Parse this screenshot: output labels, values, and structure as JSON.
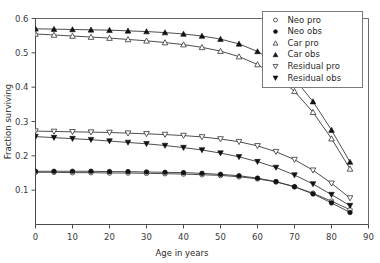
{
  "chart_data": {
    "type": "line",
    "title": "",
    "xlabel": "Age in years",
    "ylabel": "Fraction surviving",
    "xlim": [
      0,
      90
    ],
    "ylim": [
      0,
      0.6
    ],
    "xticks": [
      0,
      10,
      20,
      30,
      40,
      50,
      60,
      70,
      80,
      90
    ],
    "xticklabels": [
      "0",
      "10",
      "20",
      "30",
      "40",
      "50",
      "60",
      "70",
      "80",
      "90"
    ],
    "yticks": [
      0.1,
      0.2,
      0.3,
      0.4,
      0.5,
      0.6
    ],
    "yticklabels": [
      "0.1",
      "0.2",
      "0.3",
      "0.4",
      "0.5",
      "0.6"
    ],
    "grid": false,
    "legend_position": "upper-right",
    "x": [
      0,
      5,
      10,
      15,
      20,
      25,
      30,
      35,
      40,
      45,
      50,
      55,
      60,
      65,
      70,
      75,
      80,
      85
    ],
    "series": [
      {
        "name": "Neo pro",
        "marker": "open-circle",
        "values": [
          0.152,
          0.152,
          0.151,
          0.151,
          0.15,
          0.15,
          0.149,
          0.148,
          0.147,
          0.145,
          0.143,
          0.139,
          0.133,
          0.124,
          0.11,
          0.091,
          0.068,
          0.043
        ]
      },
      {
        "name": "Neo obs",
        "marker": "filled-circle",
        "values": [
          0.155,
          0.155,
          0.155,
          0.155,
          0.154,
          0.154,
          0.153,
          0.152,
          0.151,
          0.149,
          0.146,
          0.142,
          0.135,
          0.125,
          0.11,
          0.089,
          0.063,
          0.035
        ]
      },
      {
        "name": "Car pro",
        "marker": "open-triangle-up",
        "values": [
          0.555,
          0.552,
          0.549,
          0.546,
          0.543,
          0.539,
          0.535,
          0.53,
          0.524,
          0.516,
          0.505,
          0.489,
          0.466,
          0.433,
          0.388,
          0.327,
          0.25,
          0.162
        ]
      },
      {
        "name": "Car obs",
        "marker": "filled-triangle-up",
        "values": [
          0.57,
          0.569,
          0.568,
          0.567,
          0.566,
          0.564,
          0.562,
          0.559,
          0.555,
          0.549,
          0.54,
          0.526,
          0.504,
          0.471,
          0.424,
          0.358,
          0.275,
          0.182
        ]
      },
      {
        "name": "Residual pro",
        "marker": "open-triangle-down",
        "values": [
          0.272,
          0.271,
          0.27,
          0.269,
          0.268,
          0.266,
          0.264,
          0.262,
          0.259,
          0.255,
          0.249,
          0.241,
          0.229,
          0.212,
          0.189,
          0.158,
          0.12,
          0.077
        ]
      },
      {
        "name": "Residual obs",
        "marker": "filled-triangle-down",
        "values": [
          0.256,
          0.253,
          0.25,
          0.247,
          0.243,
          0.239,
          0.235,
          0.23,
          0.224,
          0.217,
          0.208,
          0.197,
          0.183,
          0.166,
          0.144,
          0.118,
          0.087,
          0.055
        ]
      }
    ],
    "legend": [
      {
        "label": "Neo pro",
        "marker": "open-circle"
      },
      {
        "label": "Neo obs",
        "marker": "filled-circle"
      },
      {
        "label": "Car pro",
        "marker": "open-triangle-up"
      },
      {
        "label": "Car obs",
        "marker": "filled-triangle-up"
      },
      {
        "label": "Residual pro",
        "marker": "open-triangle-down"
      },
      {
        "label": "Residual obs",
        "marker": "filled-triangle-down"
      }
    ],
    "colors": {
      "line": "#3a3a3a",
      "marker_fill": "#111111",
      "marker_open": "#ffffff",
      "axis": "#4a4a4a",
      "background": "#ffffff"
    }
  }
}
